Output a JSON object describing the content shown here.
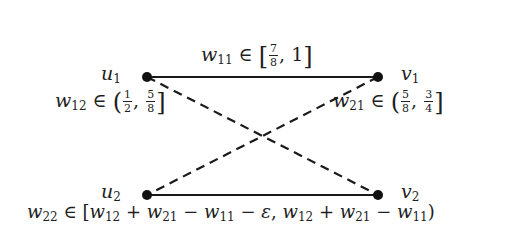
{
  "diagram": {
    "type": "bipartite-graph",
    "nodes": [
      {
        "id": "u1",
        "base": "u",
        "sub": "1",
        "x": 147,
        "y": 77
      },
      {
        "id": "v1",
        "base": "v",
        "sub": "1",
        "x": 378,
        "y": 77
      },
      {
        "id": "u2",
        "base": "u",
        "sub": "2",
        "x": 147,
        "y": 195
      },
      {
        "id": "v2",
        "base": "v",
        "sub": "2",
        "x": 378,
        "y": 195
      }
    ],
    "edges": [
      {
        "from": "u1",
        "to": "v1",
        "style": "solid",
        "label_id": "w11"
      },
      {
        "from": "u2",
        "to": "v2",
        "style": "solid",
        "label_id": "w22"
      },
      {
        "from": "u1",
        "to": "v2",
        "style": "dashed",
        "label_id": "w12"
      },
      {
        "from": "v1",
        "to": "u2",
        "style": "dashed",
        "label_id": "w21"
      }
    ],
    "colors": {
      "edge": "#1a1a1a",
      "node": "#111111",
      "background": "#ffffff"
    }
  },
  "labels": {
    "w11": {
      "var": "w",
      "sub": "11",
      "member": "∈",
      "open": "[",
      "num": "7",
      "den": "8",
      "sep": ",",
      "upper": "1",
      "close": "]",
      "text": "w11 ∈ [7/8, 1]"
    },
    "w12": {
      "var": "w",
      "sub": "12",
      "member": "∈",
      "open": "(",
      "num1": "1",
      "den1": "2",
      "sep": ",",
      "num2": "5",
      "den2": "8",
      "close": "]",
      "text": "w12 ∈ (1/2, 5/8]"
    },
    "w21": {
      "var": "w",
      "sub": "21",
      "member": "∈",
      "open": "(",
      "num1": "5",
      "den1": "8",
      "sep": ",",
      "num2": "3",
      "den2": "4",
      "close": "]",
      "text": "w21 ∈ (5/8, 3/4]"
    },
    "w22": {
      "var": "w",
      "sub": "22",
      "member": "∈",
      "open": "[",
      "t1": "w",
      "t1sub": "12",
      "plus1": "+",
      "t2": "w",
      "t2sub": "21",
      "minus1": "−",
      "t3": "w",
      "t3sub": "11",
      "minus2": "−",
      "eps": "ε",
      "sep": ",",
      "t4": "w",
      "t4sub": "12",
      "plus2": "+",
      "t5": "w",
      "t5sub": "21",
      "minus3": "−",
      "t6": "w",
      "t6sub": "11",
      "close": ")",
      "text": "w22 ∈ [w12 + w21 − w11 − ε, w12 + w21 − w11)"
    }
  }
}
